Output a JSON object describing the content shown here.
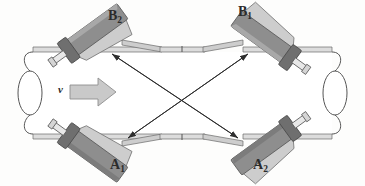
{
  "figure": {
    "kind": "diagram",
    "background_color": "#fdfdfc",
    "line_color": "#3a3a3a"
  },
  "labels": {
    "b2": {
      "base": "B",
      "sub": "2"
    },
    "b1": {
      "base": "B",
      "sub": "1"
    },
    "a1": {
      "base": "A",
      "sub": "1"
    },
    "a2": {
      "base": "A",
      "sub": "2"
    },
    "velocity": "v"
  },
  "colors": {
    "pipe_fill": "#ffffff",
    "pipe_wall_light": "#dcdcdc",
    "pipe_wall_mid": "#b9b9b9",
    "transducer_body": "#8e8e8e",
    "transducer_edge": "#6f6f6f",
    "wedge_light": "#cfcfcf",
    "wedge_mid": "#bdbdbd",
    "arrow_fill": "#c9c9c9",
    "outline": "#4a4a4a",
    "beam": "#2e2e2e"
  },
  "beams": [
    {
      "name": "beam-a1-to-b1",
      "from": "A1",
      "to": "B1",
      "direction": "upstream-to-downstream"
    },
    {
      "name": "beam-a2-to-b2",
      "from": "A2",
      "to": "B2",
      "direction": "downstream-to-upstream"
    }
  ],
  "transducers": [
    {
      "id": "B2",
      "position": "top-left",
      "stub_side": "upper-left"
    },
    {
      "id": "B1",
      "position": "top-right",
      "stub_side": "upper-right"
    },
    {
      "id": "A1",
      "position": "bottom-left",
      "stub_side": "lower-left"
    },
    {
      "id": "A2",
      "position": "bottom-right",
      "stub_side": "lower-right"
    }
  ],
  "flow": {
    "arrow_label": "v",
    "arrow_direction": "right"
  }
}
